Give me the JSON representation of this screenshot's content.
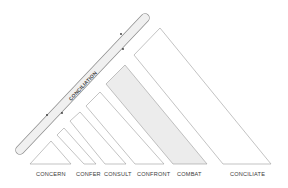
{
  "diagram": {
    "bar_label": "CONCILIATION",
    "stages": [
      {
        "label": "CONCERN",
        "shaded": false
      },
      {
        "label": "CONFER",
        "shaded": false
      },
      {
        "label": "CONSULT",
        "shaded": false
      },
      {
        "label": "CONFRONT",
        "shaded": false
      },
      {
        "label": "COMBAT",
        "shaded": true
      },
      {
        "label": "CONCILIATE",
        "shaded": false
      }
    ],
    "colors": {
      "line": "#9a9a9a",
      "shade": "#ececec",
      "bar_fill": "#f0f0f0",
      "text": "#3a3a3a"
    }
  }
}
